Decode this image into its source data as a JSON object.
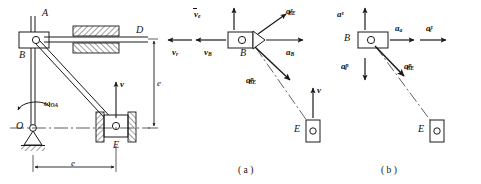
{
  "figure": {
    "caption_a": "( a )",
    "caption_b": "( b )"
  },
  "mechanism": {
    "points": {
      "A": "A",
      "B": "B",
      "D": "D",
      "O": "O",
      "E": "E"
    },
    "omega_symbol": "ω",
    "omega_sub": "OA",
    "velocity_label": "v",
    "dim_vertical": "e",
    "dim_horizontal": "e"
  },
  "diagram_a": {
    "point_B": "B",
    "point_E": "E",
    "vectors": [
      {
        "name": "v-bar-e",
        "base": "v",
        "sup": "",
        "sub": "e",
        "overbar": true,
        "text": "v",
        "sub_text": "e"
      },
      {
        "name": "v-r",
        "base": "v",
        "sup": "",
        "sub": "r",
        "overbar": false,
        "text": "v",
        "sub_text": "r"
      },
      {
        "name": "v-B",
        "base": "v",
        "sup": "",
        "sub": "B",
        "overbar": false,
        "text": "v",
        "sub_text": "B"
      },
      {
        "name": "a-B",
        "base": "a",
        "sup": "",
        "sub": "B",
        "overbar": false,
        "text": "a",
        "sub_text": "B"
      },
      {
        "name": "a-tau-BE",
        "base": "a",
        "sup": "τ",
        "sub": "BE",
        "overbar": false,
        "text": "a",
        "sub_text": "BE"
      },
      {
        "name": "a-n-BE",
        "base": "a",
        "sup": "n",
        "sub": "BE",
        "overbar": false,
        "text": "a",
        "sub_text": "BE"
      }
    ],
    "v_label": "v"
  },
  "diagram_b": {
    "point_B": "B",
    "point_E": "E",
    "vectors": [
      {
        "name": "a-tau",
        "base": "a",
        "sup": "τ",
        "sub": "",
        "text": "a",
        "sub_text": ""
      },
      {
        "name": "a-a",
        "base": "a",
        "sup": "",
        "sub": "a",
        "text": "a",
        "sub_text": "a"
      },
      {
        "name": "a-tau-e",
        "base": "a",
        "sup": "τ",
        "sub": "e",
        "text": "a",
        "sub_text": "e"
      },
      {
        "name": "a-n-e",
        "base": "a",
        "sup": "n",
        "sub": "e",
        "text": "a",
        "sub_text": "e"
      },
      {
        "name": "a-n-BE",
        "base": "a",
        "sup": "n",
        "sub": "BE",
        "text": "a",
        "sub_text": "BE"
      }
    ]
  },
  "style": {
    "line_color": "#1a1a1a",
    "hatch_color": "#2a2a2a",
    "background": "#ffffff"
  }
}
